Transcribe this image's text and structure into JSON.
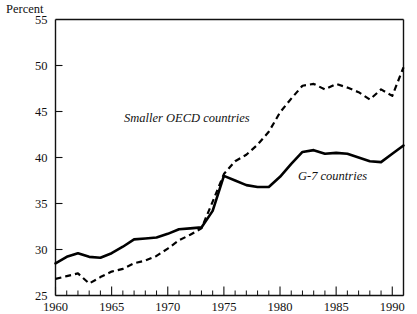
{
  "chart_data": {
    "type": "line",
    "title": "",
    "ylabel": "Percent",
    "xlabel": "",
    "ylim": [
      25,
      55
    ],
    "xlim": [
      1960,
      1991
    ],
    "grid": false,
    "legend_position": "inline-annotations",
    "y_ticks": [
      25,
      30,
      35,
      40,
      45,
      50,
      55
    ],
    "y_tick_labels": [
      "25",
      "30",
      "35",
      "40",
      "45",
      "50",
      "55"
    ],
    "x_ticks": [
      1960,
      1965,
      1970,
      1975,
      1980,
      1985,
      1990
    ],
    "x_tick_labels": [
      "1960",
      "1965",
      "1970",
      "1975",
      "1980",
      "1985",
      "1990"
    ],
    "x_minor_tick_interval": 1,
    "x": [
      1960,
      1961,
      1962,
      1963,
      1964,
      1965,
      1966,
      1967,
      1968,
      1969,
      1970,
      1971,
      1972,
      1973,
      1974,
      1975,
      1976,
      1977,
      1978,
      1979,
      1980,
      1981,
      1982,
      1983,
      1984,
      1985,
      1986,
      1987,
      1988,
      1989,
      1990,
      1991
    ],
    "series": [
      {
        "name": "G-7 countries",
        "style": "solid",
        "label_text": "G-7 countries",
        "values": [
          28.5,
          29.2,
          29.6,
          29.2,
          29.1,
          29.6,
          30.3,
          31.1,
          31.2,
          31.3,
          31.7,
          32.2,
          32.3,
          32.4,
          34.2,
          38.0,
          37.5,
          37.0,
          36.8,
          36.8,
          37.9,
          39.3,
          40.6,
          40.8,
          40.4,
          40.5,
          40.4,
          40.0,
          39.6,
          39.5,
          40.4,
          41.3
        ]
      },
      {
        "name": "Smaller OECD countries",
        "style": "dashed",
        "label_text": "Smaller OECD countries",
        "values": [
          26.8,
          27.1,
          27.4,
          26.3,
          27.0,
          27.6,
          27.9,
          28.5,
          28.8,
          29.3,
          30.1,
          31.0,
          31.6,
          32.3,
          35.2,
          38.2,
          39.6,
          40.3,
          41.4,
          42.8,
          44.9,
          46.4,
          47.8,
          48.0,
          47.4,
          48.0,
          47.6,
          47.1,
          46.3,
          47.4,
          46.7,
          49.8
        ]
      }
    ],
    "annotations": [
      {
        "text": "Smaller OECD countries",
        "x_pixel": 124,
        "y_pixel": 122
      },
      {
        "text": "G-7 countries",
        "x_pixel": 298,
        "y_pixel": 180
      }
    ]
  }
}
